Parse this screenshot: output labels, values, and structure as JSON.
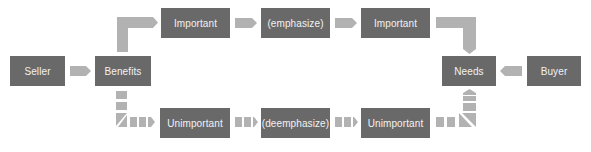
{
  "colors": {
    "box": "#696969",
    "connector": "#b2b2b2",
    "text": "#f2f2f2",
    "background": "#ffffff"
  },
  "nodes": {
    "seller": "Seller",
    "benefits": "Benefits",
    "important_1": "Important",
    "emphasize": "(emphasize)",
    "important_2": "Important",
    "needs": "Needs",
    "buyer": "Buyer",
    "unimportant_1": "Unimportant",
    "deemphasize": "(deemphasize)",
    "unimportant_2": "Unimportant"
  },
  "edges": [
    {
      "from": "Seller",
      "to": "Benefits",
      "style": "solid"
    },
    {
      "from": "Benefits",
      "to": "Important",
      "style": "solid"
    },
    {
      "from": "Important",
      "to": "(emphasize)",
      "style": "solid"
    },
    {
      "from": "(emphasize)",
      "to": "Important",
      "style": "solid"
    },
    {
      "from": "Important",
      "to": "Needs",
      "style": "solid"
    },
    {
      "from": "Buyer",
      "to": "Needs",
      "style": "solid"
    },
    {
      "from": "Benefits",
      "to": "Unimportant",
      "style": "dashed"
    },
    {
      "from": "Unimportant",
      "to": "(deemphasize)",
      "style": "dashed"
    },
    {
      "from": "(deemphasize)",
      "to": "Unimportant",
      "style": "dashed"
    },
    {
      "from": "Unimportant",
      "to": "Needs",
      "style": "dashed"
    }
  ]
}
